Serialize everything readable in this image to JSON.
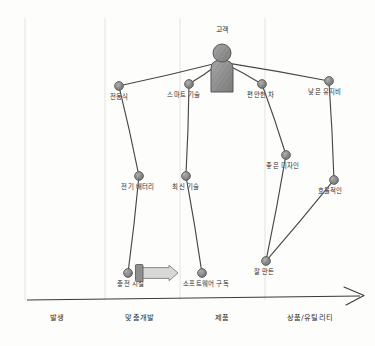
{
  "diagram": {
    "title": "",
    "type": "wardley-map",
    "colors": {
      "node_fill": "#8c8c8c",
      "node_stroke": "#555555",
      "edge": "#2f2f2f",
      "axis": "#3a3a3a",
      "grid": "#e2e2e0",
      "arrow_fill": "#d8d8d6",
      "arrow_stroke": "#8a8a88"
    },
    "anchor": {
      "label": "고객",
      "name": "anchor-customer",
      "x": 222,
      "y": 62,
      "label_x": 222,
      "label_y": 27
    },
    "nodes": [
      {
        "id": "n1",
        "label": "전동식",
        "x": 119,
        "y": 86,
        "label_x": 119,
        "label_y": 94
      },
      {
        "id": "n2",
        "label": "스마트 기술",
        "x": 189,
        "y": 84,
        "label_x": 184,
        "label_y": 92
      },
      {
        "id": "n3",
        "label": "편안한 차",
        "x": 262,
        "y": 84,
        "label_x": 261,
        "label_y": 92
      },
      {
        "id": "n4",
        "label": "낮은 유지비",
        "x": 329,
        "y": 81,
        "label_x": 325,
        "label_y": 89
      },
      {
        "id": "n5",
        "label": "전기 배터리",
        "x": 139,
        "y": 176,
        "label_x": 138,
        "label_y": 184
      },
      {
        "id": "n6",
        "label": "최신 기술",
        "x": 186,
        "y": 176,
        "label_x": 186,
        "label_y": 184
      },
      {
        "id": "n7",
        "label": "좋은 디자인",
        "x": 286,
        "y": 155,
        "label_x": 283,
        "label_y": 163
      },
      {
        "id": "n8",
        "label": "효율적인",
        "x": 334,
        "y": 180,
        "label_x": 330,
        "label_y": 188
      },
      {
        "id": "n9",
        "label": "잘 만든",
        "x": 266,
        "y": 261,
        "label_x": 264,
        "label_y": 269
      },
      {
        "id": "n10",
        "label": "충전 시설",
        "x": 128,
        "y": 273,
        "label_x": 131,
        "label_y": 281
      },
      {
        "id": "n11",
        "label": "소프트웨어 구독",
        "x": 202,
        "y": 273,
        "label_x": 206,
        "label_y": 281
      }
    ],
    "edges": [
      {
        "from": "anchor",
        "to": "n1"
      },
      {
        "from": "anchor",
        "to": "n2"
      },
      {
        "from": "anchor",
        "to": "n3"
      },
      {
        "from": "anchor",
        "to": "n4"
      },
      {
        "from": "n1",
        "to": "n5"
      },
      {
        "from": "n2",
        "to": "n6"
      },
      {
        "from": "n3",
        "to": "n7"
      },
      {
        "from": "n4",
        "to": "n8"
      },
      {
        "from": "n5",
        "to": "n10"
      },
      {
        "from": "n6",
        "to": "n11"
      },
      {
        "from": "n7",
        "to": "n9"
      },
      {
        "from": "n8",
        "to": "n9"
      }
    ],
    "movement": {
      "name": "evolution-arrow",
      "from_node": "n10",
      "direction": "right",
      "x1": 139,
      "x2": 178,
      "y": 273
    },
    "axis": {
      "name": "evolution-axis",
      "y": 300,
      "x_start": 27,
      "x_end": 360,
      "stages": [
        {
          "label": "발생",
          "x": 57,
          "boundary_x": 25
        },
        {
          "label": "맞춤개발",
          "x": 140,
          "boundary_x": 105
        },
        {
          "label": "제품",
          "x": 222,
          "boundary_x": 180
        },
        {
          "label": "상품/유틸리티",
          "x": 310,
          "boundary_x": 265
        }
      ]
    }
  }
}
